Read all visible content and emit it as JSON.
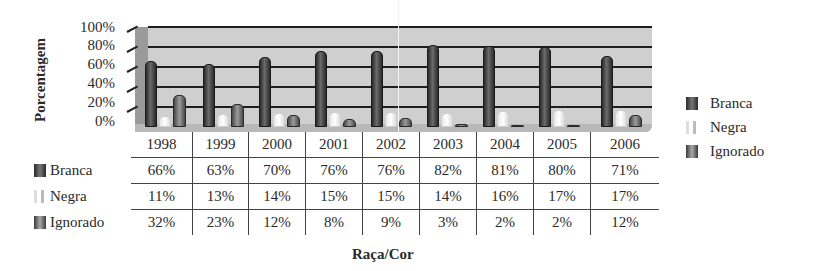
{
  "chart_data": {
    "type": "bar",
    "title": "",
    "xlabel": "Raça/Cor",
    "ylabel": "Porcentagem",
    "ylim": [
      0,
      100
    ],
    "yticks": [
      "0%",
      "20%",
      "40%",
      "60%",
      "80%",
      "100%"
    ],
    "grid": true,
    "legend_position": "right",
    "categories": [
      "1998",
      "1999",
      "2000",
      "2001",
      "2002",
      "2003",
      "2004",
      "2005",
      "2006"
    ],
    "series": [
      {
        "name": "Branca",
        "values": [
          66,
          63,
          70,
          76,
          76,
          82,
          81,
          80,
          71
        ],
        "labels": [
          "66%",
          "63%",
          "70%",
          "76%",
          "76%",
          "82%",
          "81%",
          "80%",
          "71%"
        ],
        "color": "#3a3a3a"
      },
      {
        "name": "Negra",
        "values": [
          11,
          13,
          14,
          15,
          15,
          14,
          16,
          17,
          17
        ],
        "labels": [
          "11%",
          "13%",
          "14%",
          "15%",
          "15%",
          "14%",
          "16%",
          "17%",
          "17%"
        ],
        "color": "#f0f0f0"
      },
      {
        "name": "Ignorado",
        "values": [
          32,
          23,
          12,
          8,
          9,
          3,
          2,
          2,
          12
        ],
        "labels": [
          "32%",
          "23%",
          "12%",
          "8%",
          "9%",
          "3%",
          "2%",
          "2%",
          "12%"
        ],
        "color": "#7a7a7a"
      }
    ],
    "data_table": true
  },
  "axis": {
    "ylabel": "Porcentagem",
    "xlabel": "Raça/Cor",
    "yticks": [
      "100%",
      "80%",
      "60%",
      "40%",
      "20%",
      "0%"
    ]
  },
  "legend": [
    "Branca",
    "Negra",
    "Ignorado"
  ]
}
